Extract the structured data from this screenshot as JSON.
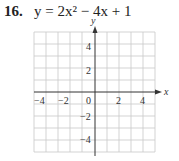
{
  "problem": {
    "number": "16.",
    "equation": "y = 2x² − 4x + 1"
  },
  "graph": {
    "x_axis_label": "x",
    "y_axis_label": "y",
    "x_ticks": [
      "−4",
      "−2",
      "0",
      "2",
      "4"
    ],
    "y_ticks": [
      "4",
      "2",
      "−2",
      "−4"
    ],
    "x_range": [
      -5,
      5
    ],
    "y_range": [
      -5,
      5
    ],
    "grid_step": 1
  }
}
